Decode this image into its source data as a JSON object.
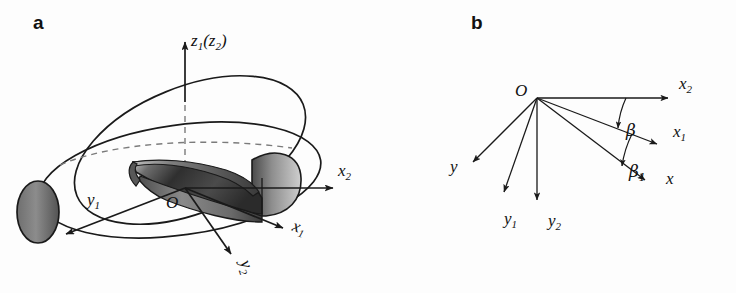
{
  "figure": {
    "background_color": "#fdfdfd",
    "ink_color": "#1a1a1a",
    "hidden_line_color": "#7b7b7b",
    "panels": [
      {
        "letter": "a",
        "type": "3d-coordinate-systems-with-twisted-blade",
        "description": "Two tilted ellipses intersecting about a vertical axis with a shaded twisted blade and cylinder end caps at the centre",
        "origin_label": "O",
        "axes": [
          {
            "name": "z1z2",
            "label_parts": {
              "main": "z",
              "sub": "1",
              "paren_main": "z",
              "paren_sub": "2"
            },
            "label": "z1(z2)",
            "direction": "up"
          },
          {
            "name": "x2",
            "label_main": "x",
            "label_sub": "2",
            "direction": "right"
          },
          {
            "name": "x1",
            "label_main": "x",
            "label_sub": "1",
            "direction": "down-right"
          },
          {
            "name": "y1",
            "label_main": "y",
            "label_sub": "1",
            "direction": "down-left"
          },
          {
            "name": "y2",
            "label_main": "y",
            "label_sub": "2",
            "direction": "down"
          }
        ]
      },
      {
        "letter": "b",
        "type": "planar-ray-diagram",
        "description": "Five labelled rays emanating from a common origin O with two marked angles",
        "origin_label": "O",
        "rays": [
          {
            "name": "x2",
            "label_main": "x",
            "label_sub": "2"
          },
          {
            "name": "x1",
            "label_main": "x",
            "label_sub": "1"
          },
          {
            "name": "x",
            "label_main": "x",
            "label_sub": ""
          },
          {
            "name": "y",
            "label_main": "y",
            "label_sub": ""
          },
          {
            "name": "y1",
            "label_main": "y",
            "label_sub": "1"
          },
          {
            "name": "y2",
            "label_main": "y",
            "label_sub": "2"
          }
        ],
        "angles": [
          {
            "name": "beta",
            "label_main": "β",
            "label_sub": "",
            "between": "x2-to-x1"
          },
          {
            "name": "beta1",
            "label_main": "β",
            "label_sub": "1",
            "between": "x1-to-x"
          }
        ]
      }
    ]
  }
}
